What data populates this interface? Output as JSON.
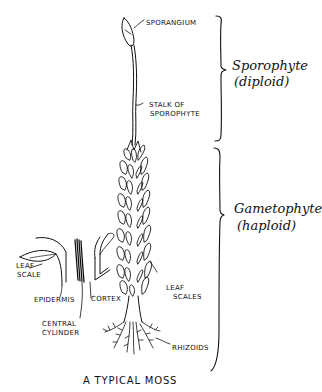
{
  "diagram": {
    "title": "A TYPICAL MOSS",
    "labels": {
      "sporangium": "SPORANGIUM",
      "stalk_line1": "STALK OF",
      "stalk_line2": "SPOROPHYTE",
      "leaf_scales_line1": "LEAF",
      "leaf_scales_line2": "SCALES",
      "rhizoids": "RHIZOIDS",
      "leaf_scale_line1": "LEAF",
      "leaf_scale_line2": "SCALE",
      "epidermis": "EPIDERMIS",
      "cortex": "CORTEX",
      "central_line1": "CENTRAL",
      "central_line2": "CYLINDER"
    },
    "generations": {
      "sporophyte_line1": "Sporophyte",
      "sporophyte_line2": "(diploid)",
      "gametophyte_line1": "Gametophyte",
      "gametophyte_line2": "(haploid)"
    }
  }
}
